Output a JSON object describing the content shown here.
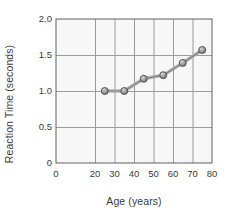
{
  "chart_data": {
    "type": "line",
    "title": "",
    "xlabel": "Age (years)",
    "ylabel": "Reaction Time (seconds)",
    "x": [
      25,
      35,
      45,
      55,
      65,
      75
    ],
    "values": [
      1.0,
      1.0,
      1.17,
      1.22,
      1.39,
      1.57
    ],
    "series": [
      {
        "name": "Reaction Time",
        "values": [
          1.0,
          1.0,
          1.17,
          1.22,
          1.39,
          1.57
        ]
      }
    ],
    "xlim": [
      0,
      80
    ],
    "ylim": [
      0,
      2.0
    ],
    "xticks": [
      "0",
      "20",
      "30",
      "40",
      "50",
      "60",
      "70",
      "80"
    ],
    "xtick_values": [
      0,
      20,
      30,
      40,
      50,
      60,
      70,
      80
    ],
    "yticks": [
      "0",
      "0.5",
      "1.0",
      "1.5",
      "2.0"
    ],
    "ytick_values": [
      0,
      0.5,
      1.0,
      1.5,
      2.0
    ],
    "grid": true,
    "legend": "none",
    "marker": "circle",
    "colors": {
      "line": "#808080",
      "marker_fill": "#9a9a9a",
      "marker_edge": "#4d4d4d",
      "grid": "#9a9a9a",
      "axis": "#6e6e6e",
      "plot_background": "#f7f7f7",
      "figure_background": "#ffffff",
      "text": "#3c3c3c"
    }
  }
}
